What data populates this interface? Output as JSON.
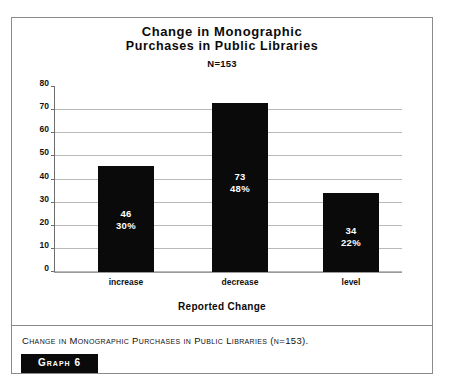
{
  "figure": {
    "title_line1": "Change in Monographic",
    "title_line2": "Purchases in Public Libraries",
    "subtitle": "N=153",
    "caption": "Change in Monographic Purchases in Public Libraries (n=153).",
    "badge_label": "Graph 6"
  },
  "chart_data": {
    "type": "bar",
    "title": "Change in Monographic Purchases in Public Libraries",
    "subtitle": "N=153",
    "xlabel": "Reported Change",
    "ylabel": "",
    "ylim": [
      0,
      80
    ],
    "yticks": [
      0,
      10,
      20,
      30,
      40,
      50,
      60,
      70,
      80
    ],
    "ytick_labels": [
      "0",
      "10",
      "20",
      "30",
      "40",
      "50",
      "60",
      "70",
      "80"
    ],
    "grid": true,
    "legend": false,
    "bar_color": "#0a0a0a",
    "categories": [
      "increase",
      "decrease",
      "level"
    ],
    "values": [
      46,
      73,
      34
    ],
    "value_labels": [
      "46",
      "73",
      "34"
    ],
    "percent_labels": [
      "30%",
      "48%",
      "22%"
    ],
    "percents": [
      30,
      48,
      22
    ],
    "n": 153
  }
}
